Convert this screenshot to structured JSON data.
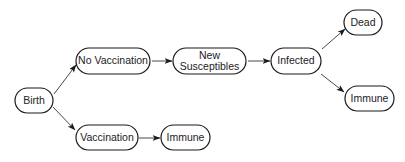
{
  "diagram": {
    "type": "flowchart",
    "nodes": [
      {
        "id": "birth",
        "lines": [
          "Birth"
        ]
      },
      {
        "id": "no_vaccination",
        "lines": [
          "No Vaccination"
        ]
      },
      {
        "id": "new_susceptibles",
        "lines": [
          "New",
          "Susceptibles"
        ]
      },
      {
        "id": "infected",
        "lines": [
          "Infected"
        ]
      },
      {
        "id": "dead",
        "lines": [
          "Dead"
        ]
      },
      {
        "id": "immune_infected",
        "lines": [
          "Immune"
        ]
      },
      {
        "id": "vaccination",
        "lines": [
          "Vaccination"
        ]
      },
      {
        "id": "immune_vaccinated",
        "lines": [
          "Immune"
        ]
      }
    ],
    "edges": [
      {
        "from": "birth",
        "to": "no_vaccination"
      },
      {
        "from": "birth",
        "to": "vaccination"
      },
      {
        "from": "no_vaccination",
        "to": "new_susceptibles"
      },
      {
        "from": "new_susceptibles",
        "to": "infected"
      },
      {
        "from": "infected",
        "to": "dead"
      },
      {
        "from": "infected",
        "to": "immune_infected"
      },
      {
        "from": "vaccination",
        "to": "immune_vaccinated"
      }
    ],
    "colors": {
      "stroke": "#1a1a1a",
      "fill": "#ffffff",
      "text": "#222222"
    }
  }
}
